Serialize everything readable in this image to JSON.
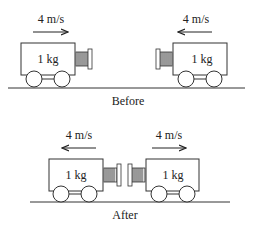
{
  "before": {
    "caption": "Before",
    "left_cart": {
      "mass": "1 kg",
      "velocity": "4 m/s",
      "direction": "right"
    },
    "right_cart": {
      "mass": "1 kg",
      "velocity": "4 m/s",
      "direction": "left"
    }
  },
  "after": {
    "caption": "After",
    "left_cart": {
      "mass": "1 kg",
      "velocity": "4 m/s",
      "direction": "left"
    },
    "right_cart": {
      "mass": "1 kg",
      "velocity": "4 m/s",
      "direction": "right"
    }
  }
}
